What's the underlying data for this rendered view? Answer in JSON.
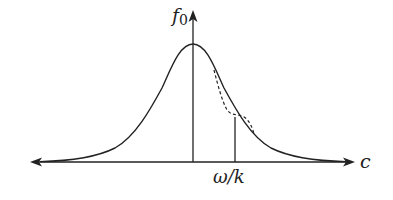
{
  "diagram": {
    "type": "distribution-function-plot",
    "labels": {
      "y_axis": "f",
      "y_axis_sub": "0",
      "x_axis": "c",
      "marker": "ω/k"
    },
    "curves": [
      {
        "name": "maxwellian",
        "style": "solid",
        "color": "#222222"
      },
      {
        "name": "perturbed-plateau",
        "style": "dashed",
        "color": "#222222"
      }
    ],
    "colors": {
      "stroke": "#222222",
      "background": "#ffffff"
    }
  }
}
